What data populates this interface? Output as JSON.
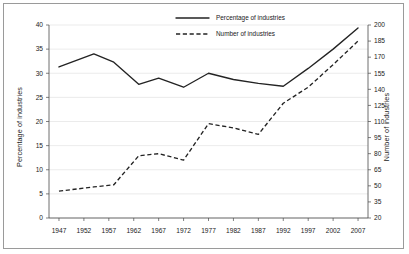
{
  "chart_data": {
    "type": "line",
    "title": "",
    "xlabel": "",
    "ylabel": "Percentage of industries",
    "y2label": "Number of industries",
    "grid": true,
    "legend_position": "top-center",
    "x": [
      1947,
      1954,
      1958,
      1963,
      1967,
      1972,
      1977,
      1982,
      1987,
      1992,
      1997,
      2002,
      2007
    ],
    "xtick_labels": [
      "1947",
      "1952",
      "1957",
      "1962",
      "1967",
      "1972",
      "1977",
      "1982",
      "1987",
      "1992",
      "1997",
      "2002",
      "2007"
    ],
    "xtick_values": [
      1947,
      1952,
      1957,
      1962,
      1967,
      1972,
      1977,
      1982,
      1987,
      1992,
      1997,
      2002,
      2007
    ],
    "xlim": [
      1945,
      2009
    ],
    "ylim": [
      0,
      40
    ],
    "ytick_labels": [
      "0",
      "5",
      "10",
      "15",
      "20",
      "25",
      "30",
      "35",
      "40"
    ],
    "ytick_values": [
      0,
      5,
      10,
      15,
      20,
      25,
      30,
      35,
      40
    ],
    "y2lim": [
      20,
      200
    ],
    "y2tick_labels": [
      "20",
      "35",
      "50",
      "65",
      "80",
      "95",
      "110",
      "125",
      "140",
      "155",
      "170",
      "185",
      "200"
    ],
    "y2tick_values": [
      20,
      35,
      50,
      65,
      80,
      95,
      110,
      125,
      140,
      155,
      170,
      185,
      200
    ],
    "series": [
      {
        "name": "Percentage of industries",
        "axis": "left",
        "style": "solid",
        "color": "#232323",
        "values": [
          31.3,
          34.0,
          32.3,
          27.7,
          29.0,
          27.1,
          30.0,
          28.7,
          27.9,
          27.3,
          31.0,
          35.0,
          39.4
        ]
      },
      {
        "name": "Number of industries",
        "axis": "right",
        "style": "dashed",
        "color": "#232323",
        "values": [
          45,
          49,
          51,
          78,
          80,
          74,
          108,
          104,
          98,
          127,
          142,
          163,
          185
        ]
      }
    ],
    "legend": [
      {
        "label": "Percentage of industries",
        "style": "solid"
      },
      {
        "label": "Number of industries",
        "style": "dashed"
      }
    ]
  }
}
